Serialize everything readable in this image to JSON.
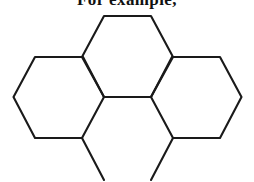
{
  "figure": {
    "caption": "For example,",
    "caption_clipped": true,
    "background_color": "#ffffff",
    "stroke_color": "#1a1a1a",
    "stroke_width": 2.1,
    "canvas": {
      "width": 254,
      "height": 182
    },
    "diagram": {
      "type": "hexagonal-ring-skeleton",
      "orientation": "flat-top",
      "circumradius": 45,
      "ring_count_visible": 3,
      "ring_count_partial": 1,
      "rings": [
        {
          "name": "top-ring",
          "label": "ring-A",
          "center": [
            127.5,
            56
          ],
          "complete": true,
          "vertices": [
            [
              104,
              16
            ],
            [
              151,
              16
            ],
            [
              172.5,
              56
            ],
            [
              151,
              97
            ],
            [
              104,
              97
            ],
            [
              82.5,
              56
            ]
          ]
        },
        {
          "name": "left-ring",
          "label": "ring-B",
          "center": [
            58,
            97
          ],
          "complete": true,
          "vertices": [
            [
              35,
              57
            ],
            [
              82,
              57
            ],
            [
              104,
              97
            ],
            [
              82,
              138
            ],
            [
              35,
              138
            ],
            [
              13.5,
              97
            ]
          ]
        },
        {
          "name": "right-ring",
          "label": "ring-C",
          "center": [
            197,
            97
          ],
          "complete": true,
          "vertices": [
            [
              173,
              57
            ],
            [
              220,
              57
            ],
            [
              241.5,
              97
            ],
            [
              220,
              138
            ],
            [
              173,
              138
            ],
            [
              151,
              97
            ]
          ]
        },
        {
          "name": "bottom-ring-partial",
          "label": "ring-D",
          "center": [
            127.5,
            138
          ],
          "complete": false,
          "clipped_by": "bottom-edge",
          "vertices": [
            [
              104,
              97
            ],
            [
              151,
              97
            ],
            [
              173,
              138
            ],
            [
              151,
              179
            ],
            [
              104,
              179
            ],
            [
              82,
              138
            ]
          ]
        }
      ],
      "fusion_bonds": [
        {
          "name": "central-bond",
          "from": [
            104,
            97
          ],
          "to": [
            151,
            97
          ]
        },
        {
          "name": "top-left-fusion-bond",
          "from": [
            82.5,
            56
          ],
          "to": [
            104,
            97
          ]
        },
        {
          "name": "top-right-fusion-bond",
          "from": [
            172.5,
            56
          ],
          "to": [
            151,
            97
          ]
        },
        {
          "name": "bottom-left-fusion-bond",
          "from": [
            104,
            97
          ],
          "to": [
            82,
            138
          ]
        },
        {
          "name": "bottom-right-fusion-bond",
          "from": [
            151,
            97
          ],
          "to": [
            173,
            138
          ]
        }
      ],
      "open_stubs": [
        {
          "name": "bottom-left-stub",
          "from": [
            82,
            138
          ],
          "to": [
            104,
            179
          ]
        },
        {
          "name": "bottom-right-stub",
          "from": [
            173,
            138
          ],
          "to": [
            151,
            179
          ]
        }
      ]
    }
  }
}
